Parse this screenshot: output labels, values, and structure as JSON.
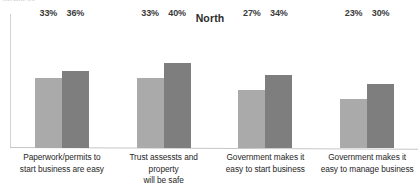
{
  "top_clip_text": "business",
  "chart_data": {
    "type": "bar",
    "title": "North",
    "xlabel": "",
    "ylabel": "",
    "ylim": [
      0,
      60
    ],
    "grid": false,
    "legend": "none",
    "value_suffix": "%",
    "categories": [
      "Paperwork/permits to start business are easy",
      "Trust assessts and property will be safe",
      "Government makes it easy to start business",
      "Government makes it easy to manage business"
    ],
    "category_lines": [
      [
        "Paperwork/permits to",
        "start business are easy"
      ],
      [
        "Trust assessts and property",
        "will be safe"
      ],
      [
        "Government makes it",
        "easy to start business"
      ],
      [
        "Government makes it",
        "easy to manage business"
      ]
    ],
    "series": [
      {
        "name": "Series 1",
        "color": "#aaaaaa",
        "values": [
          33,
          33,
          27,
          23
        ],
        "labels": [
          "33%",
          "33%",
          "27%",
          "23%"
        ]
      },
      {
        "name": "Series 2",
        "color": "#7e7e7e",
        "values": [
          36,
          40,
          34,
          30
        ],
        "labels": [
          "36%",
          "40%",
          "34%",
          "30%"
        ]
      }
    ]
  },
  "colors": {
    "series1": "#aaaaaa",
    "series2": "#7e7e7e",
    "axis": "#c6c6c6",
    "text": "#262626",
    "title": "#2b2b2b"
  }
}
